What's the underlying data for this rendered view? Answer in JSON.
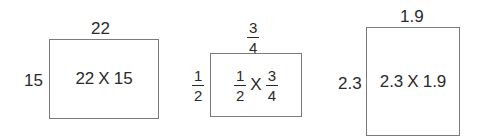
{
  "rectangles": [
    {
      "top_label": "22",
      "side_label": "15",
      "center": {
        "left": "22",
        "sep": "X",
        "right": "15"
      }
    },
    {
      "top_label": {
        "num": "3",
        "den": "4"
      },
      "side_label": {
        "num": "1",
        "den": "2"
      },
      "center": {
        "left": {
          "num": "1",
          "den": "2"
        },
        "sep": "X",
        "right": {
          "num": "3",
          "den": "4"
        }
      }
    },
    {
      "top_label": "1.9",
      "side_label": "2.3",
      "center": {
        "left": "2.3",
        "sep": "X",
        "right": "1.9"
      }
    }
  ]
}
